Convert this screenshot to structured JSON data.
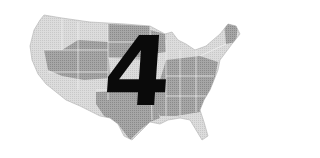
{
  "map": {
    "subject": "United States (contiguous)",
    "style": "grayscale halftone",
    "colors": {
      "background": "#ffffff",
      "light_region": "#d9d9d9",
      "dark_region": "#9c9c9c",
      "border": "#f2f2f2",
      "numeral": "#0a0a0a"
    }
  },
  "overlay": {
    "numeral": "4"
  }
}
